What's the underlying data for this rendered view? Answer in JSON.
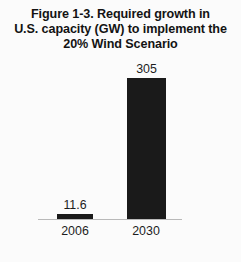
{
  "chart_data": {
    "type": "bar",
    "title": "Figure 1-3. Required growth in U.S. capacity (GW) to implement the 20% Wind Scenario",
    "title_lines": [
      "Figure 1-3. Required growth in",
      "U.S. capacity (GW) to implement the",
      "20% Wind Scenario"
    ],
    "categories": [
      "2006",
      "2030"
    ],
    "values": [
      11.6,
      305
    ],
    "value_labels": [
      "11.6",
      "305"
    ],
    "xlabel": "",
    "ylabel": "",
    "ylim": [
      0,
      305
    ],
    "grid": false,
    "legend": false,
    "units": "GW",
    "bar_color": "#1a1a1a",
    "axis_color": "#b9b9b9",
    "background_color": "#fbfbfb",
    "text_color": "#1d1d1d"
  }
}
